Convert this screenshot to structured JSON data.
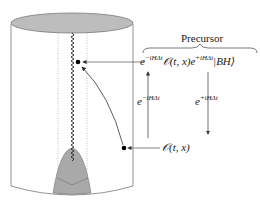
{
  "diagram": {
    "type": "penrose-cylinder-black-hole",
    "labels": {
      "precursor": "Precursor",
      "main_expression": {
        "base1": "e",
        "exp1": "−iHΔt",
        "operator": "𝒪(t, x)",
        "base2": "e",
        "exp2": "+iHΔt",
        "state": "|BH⟩"
      },
      "left_evolution": {
        "base": "e",
        "exp": "−iHΔt"
      },
      "right_evolution": {
        "base": "e",
        "exp": "+iHΔt"
      },
      "operator_label": "𝒪(t, x)"
    },
    "colors": {
      "stroke": "#555555",
      "fill_cap": "#bdbdbd",
      "fill_cone": "#a9a9a9",
      "dot": "#000000",
      "text": "#1a1a1a"
    }
  }
}
